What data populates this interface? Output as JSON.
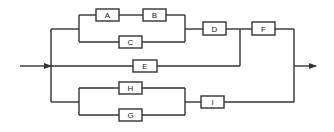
{
  "diagram": {
    "type": "reliability-block-diagram",
    "colors": {
      "line": "#333333",
      "background": "#ffffff"
    },
    "blocks": [
      {
        "id": "A",
        "label": "A",
        "x": 96,
        "y": 9,
        "w": 23,
        "h": 12
      },
      {
        "id": "B",
        "label": "B",
        "x": 143,
        "y": 9,
        "w": 23,
        "h": 12
      },
      {
        "id": "C",
        "label": "C",
        "x": 119,
        "y": 36,
        "w": 23,
        "h": 12
      },
      {
        "id": "D",
        "label": "D",
        "x": 203,
        "y": 22,
        "w": 23,
        "h": 13
      },
      {
        "id": "F",
        "label": "F",
        "x": 252,
        "y": 22,
        "w": 23,
        "h": 13
      },
      {
        "id": "E",
        "label": "E",
        "x": 133,
        "y": 60,
        "w": 24,
        "h": 12
      },
      {
        "id": "H",
        "label": "H",
        "x": 119,
        "y": 82,
        "w": 23,
        "h": 12
      },
      {
        "id": "G",
        "label": "G",
        "x": 119,
        "y": 109,
        "w": 23,
        "h": 12
      },
      {
        "id": "I",
        "label": "I",
        "x": 201,
        "y": 96,
        "w": 23,
        "h": 12
      }
    ],
    "connections": [
      "input -> split",
      "split -> (A -> B || C) -> D -> F -> output",
      "split -> E -> output (via junction between D and F)",
      "split -> (H || G) -> I -> output"
    ]
  }
}
